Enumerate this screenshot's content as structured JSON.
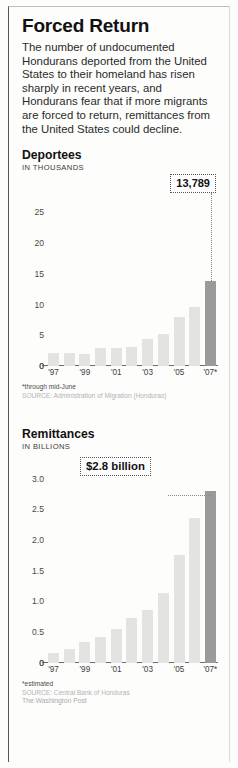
{
  "headline": "Forced Return",
  "deck": "The number of undocumented Hondurans deported from the United States to their homeland has risen sharply in recent years, and Hondurans fear that if more migrants are forced to return, remittances from the United States could decline.",
  "deportees": {
    "title": "Deportees",
    "units": "IN THOUSANDS",
    "callout": "13,789",
    "footnote": "*through mid-June",
    "source": "SOURCE: Administration of Migration (Honduras)"
  },
  "remittances": {
    "title": "Remittances",
    "units": "IN BILLIONS",
    "callout": "$2.8 billion",
    "footnote": "*estimated",
    "source": "SOURCE: Central Bank of Honduras",
    "credit": "The Washington Post"
  },
  "chart_data": [
    {
      "type": "bar",
      "title": "Deportees",
      "ylabel": "IN THOUSANDS",
      "xlabel": "",
      "ylim": [
        0,
        27
      ],
      "yticks": [
        0,
        5,
        10,
        15,
        20,
        25
      ],
      "ytick_labels": [
        "0",
        "5",
        "10",
        "15",
        "20",
        "25"
      ],
      "grid": false,
      "categories": [
        "'97",
        "",
        "'99",
        "",
        "'01",
        "",
        "'03",
        "",
        "'05",
        "",
        "'07*"
      ],
      "tick_labels": [
        "'97",
        "'99",
        "'01",
        "'03",
        "'05",
        "'07*"
      ],
      "values": [
        2.1,
        2.2,
        2.0,
        2.9,
        2.9,
        3.1,
        4.4,
        5.3,
        8.0,
        9.6,
        13.789
      ],
      "highlight_index": 10,
      "annotations": [
        {
          "text": "13,789",
          "value": 13.789,
          "points_to_index": 10
        }
      ]
    },
    {
      "type": "bar",
      "title": "Remittances",
      "ylabel": "IN BILLIONS",
      "xlabel": "",
      "ylim": [
        0,
        3.0
      ],
      "yticks": [
        0,
        0.5,
        1.0,
        1.5,
        2.0,
        2.5,
        3.0
      ],
      "ytick_labels": [
        "0",
        "0.5",
        "1.0",
        "1.5",
        "2.0",
        "2.5",
        "3.0"
      ],
      "grid": false,
      "categories": [
        "'97",
        "",
        "'99",
        "",
        "'01",
        "",
        "'03",
        "",
        "'05",
        "",
        "'07*"
      ],
      "tick_labels": [
        "'97",
        "'99",
        "'01",
        "'03",
        "'05",
        "'07*"
      ],
      "values": [
        0.16,
        0.22,
        0.33,
        0.41,
        0.54,
        0.72,
        0.86,
        1.13,
        1.76,
        2.36,
        2.8
      ],
      "highlight_index": 10,
      "annotations": [
        {
          "text": "$2.8 billion",
          "value": 2.8,
          "points_to_index": 10
        }
      ]
    }
  ]
}
